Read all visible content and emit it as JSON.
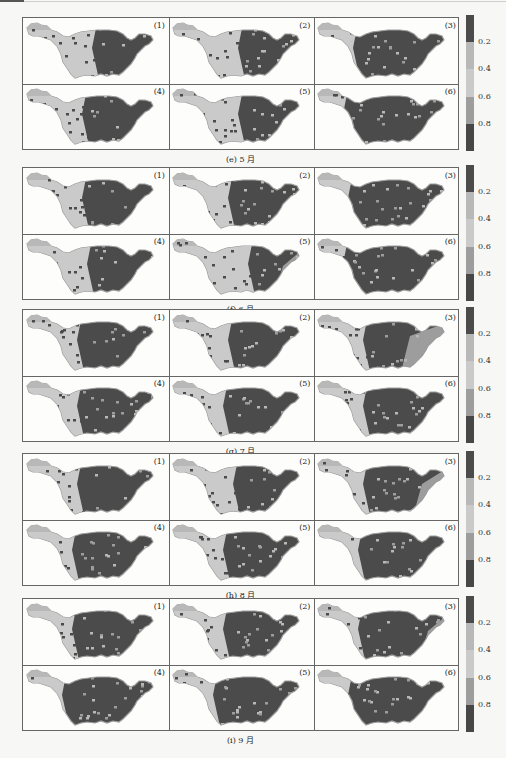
{
  "chart_data": {
    "type": "heatmap",
    "colorbar": {
      "ticks": [
        "0.2",
        "0.4",
        "0.6",
        "0.8"
      ],
      "range": [
        0,
        1
      ],
      "bands": [
        {
          "from": 0.0,
          "to": 0.2,
          "color": "#4b4b4b"
        },
        {
          "from": 0.2,
          "to": 0.4,
          "color": "#b8b8b8"
        },
        {
          "from": 0.4,
          "to": 0.6,
          "color": "#cacaca"
        },
        {
          "from": 0.6,
          "to": 0.8,
          "color": "#9d9d9d"
        },
        {
          "from": 0.8,
          "to": 1.0,
          "color": "#474747"
        }
      ]
    },
    "groups": [
      {
        "caption": "(e) 5 月",
        "panels": [
          {
            "label": "(1)",
            "light_west": 0.55,
            "east_patch": 0.0
          },
          {
            "label": "(2)",
            "light_west": 0.55,
            "east_patch": 0.0
          },
          {
            "label": "(3)",
            "light_west": 0.25,
            "east_patch": 0.3
          },
          {
            "label": "(4)",
            "light_west": 0.45,
            "east_patch": 0.0
          },
          {
            "label": "(5)",
            "light_west": 0.55,
            "east_patch": 0.0
          },
          {
            "label": "(6)",
            "light_west": 0.15,
            "east_patch": 0.0
          }
        ]
      },
      {
        "caption": "(f) 6 月",
        "panels": [
          {
            "label": "(1)",
            "light_west": 0.45,
            "east_patch": 0.1
          },
          {
            "label": "(2)",
            "light_west": 0.45,
            "east_patch": 0.0
          },
          {
            "label": "(3)",
            "light_west": 0.2,
            "east_patch": 0.3
          },
          {
            "label": "(4)",
            "light_west": 0.5,
            "east_patch": 0.1
          },
          {
            "label": "(5)",
            "light_west": 0.65,
            "east_patch": 0.4
          },
          {
            "label": "(6)",
            "light_west": 0.15,
            "east_patch": 0.0
          }
        ]
      },
      {
        "caption": "(g) 7 月",
        "panels": [
          {
            "label": "(1)",
            "light_west": 0.4,
            "east_patch": 0.1
          },
          {
            "label": "(2)",
            "light_west": 0.45,
            "east_patch": 0.0
          },
          {
            "label": "(3)",
            "light_west": 0.35,
            "east_patch": 0.7
          },
          {
            "label": "(4)",
            "light_west": 0.4,
            "east_patch": 0.0
          },
          {
            "label": "(5)",
            "light_west": 0.4,
            "east_patch": 0.0
          },
          {
            "label": "(6)",
            "light_west": 0.35,
            "east_patch": 0.0
          }
        ]
      },
      {
        "caption": "(h) 8 月",
        "panels": [
          {
            "label": "(1)",
            "light_west": 0.4,
            "east_patch": 0.0
          },
          {
            "label": "(2)",
            "light_west": 0.5,
            "east_patch": 0.0
          },
          {
            "label": "(3)",
            "light_west": 0.35,
            "east_patch": 0.5
          },
          {
            "label": "(4)",
            "light_west": 0.35,
            "east_patch": 0.0
          },
          {
            "label": "(5)",
            "light_west": 0.4,
            "east_patch": 0.0
          },
          {
            "label": "(6)",
            "light_west": 0.3,
            "east_patch": 0.0
          }
        ]
      },
      {
        "caption": "(i) 9 月",
        "panels": [
          {
            "label": "(1)",
            "light_west": 0.35,
            "east_patch": 0.25
          },
          {
            "label": "(2)",
            "light_west": 0.4,
            "east_patch": 0.0
          },
          {
            "label": "(3)",
            "light_west": 0.3,
            "east_patch": 0.4
          },
          {
            "label": "(4)",
            "light_west": 0.25,
            "east_patch": 0.0
          },
          {
            "label": "(5)",
            "light_west": 0.3,
            "east_patch": 0.0
          },
          {
            "label": "(6)",
            "light_west": 0.2,
            "east_patch": 0.0
          }
        ]
      }
    ]
  }
}
